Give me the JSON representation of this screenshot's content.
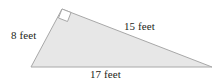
{
  "figure": {
    "background_color": "#ffffff",
    "shape": {
      "name": "right-triangle",
      "fill_color": "#e7e7e7",
      "stroke_color": "#a8a8a8",
      "stroke_width": 1,
      "vertices": {
        "top": [
          62,
          9
        ],
        "bottom_right": [
          212,
          67
        ],
        "bottom_left": [
          31,
          67
        ]
      },
      "points_attr": "62,9 212,67 31,67"
    },
    "right_angle_marker": {
      "name": "right-angle-marker",
      "at_vertex": "top",
      "fill_color": "#ffffff",
      "stroke_color": "#a8a8a8",
      "points_attr": "62,9 71,12.5 67.5,21.5 58.5,18"
    },
    "labels": {
      "leg_vertical": {
        "text": "8 feet",
        "value": 8,
        "unit": "feet",
        "side": "vertical-leg"
      },
      "hypotenuse": {
        "text": "15 feet",
        "value": 15,
        "unit": "feet",
        "side": "hypotenuse"
      },
      "base": {
        "text": "17 feet",
        "value": 17,
        "unit": "feet",
        "side": "base"
      }
    },
    "text_color": "#231f20"
  }
}
